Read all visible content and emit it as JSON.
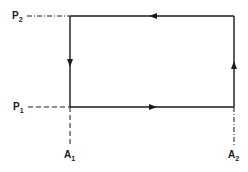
{
  "diagram": {
    "type": "thermodynamic-cycle",
    "shape": "rectangle",
    "direction": "clockwise",
    "colors": {
      "line": "#1a1a1a",
      "background": "#ffffff"
    },
    "labels": {
      "p2": {
        "main": "P",
        "sub": "2"
      },
      "p1": {
        "main": "P",
        "sub": "1"
      },
      "a1": {
        "main": "A",
        "sub": "1"
      },
      "a2": {
        "main": "A",
        "sub": "2"
      }
    },
    "edges": [
      {
        "name": "top",
        "from": "A2,P2",
        "to": "A1,P2",
        "arrow": "left"
      },
      {
        "name": "left",
        "from": "A1,P2",
        "to": "A1,P1",
        "arrow": "down"
      },
      {
        "name": "bottom",
        "from": "A1,P1",
        "to": "A2,P1",
        "arrow": "right"
      },
      {
        "name": "right",
        "from": "A2,P1",
        "to": "A2,P2",
        "arrow": "up"
      }
    ],
    "guides": [
      {
        "name": "p2-guide",
        "style": "dash-dot"
      },
      {
        "name": "p1-guide",
        "style": "dashed"
      },
      {
        "name": "a1-guide",
        "style": "dashed"
      },
      {
        "name": "a2-guide",
        "style": "dash-dot"
      }
    ]
  }
}
